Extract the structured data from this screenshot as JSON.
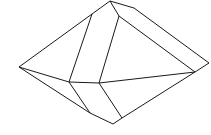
{
  "diagram": {
    "type": "crystal-line-drawing",
    "stroke": "#1a1a1a",
    "background": "#ffffff",
    "edges": [
      [
        19,
        67,
        92,
        14
      ],
      [
        92,
        14,
        110,
        1
      ],
      [
        110,
        1,
        134,
        8
      ],
      [
        134,
        8,
        209,
        63
      ],
      [
        209,
        63,
        195,
        72
      ],
      [
        110,
        1,
        119,
        16
      ],
      [
        119,
        16,
        195,
        72
      ],
      [
        92,
        14,
        69,
        82
      ],
      [
        119,
        16,
        99,
        83
      ],
      [
        19,
        67,
        69,
        82
      ],
      [
        69,
        82,
        99,
        83
      ],
      [
        99,
        83,
        195,
        72
      ],
      [
        19,
        67,
        90,
        113
      ],
      [
        90,
        113,
        113,
        124
      ],
      [
        113,
        124,
        122,
        118
      ],
      [
        122,
        118,
        195,
        72
      ],
      [
        69,
        82,
        90,
        113
      ],
      [
        99,
        83,
        122,
        118
      ]
    ]
  }
}
